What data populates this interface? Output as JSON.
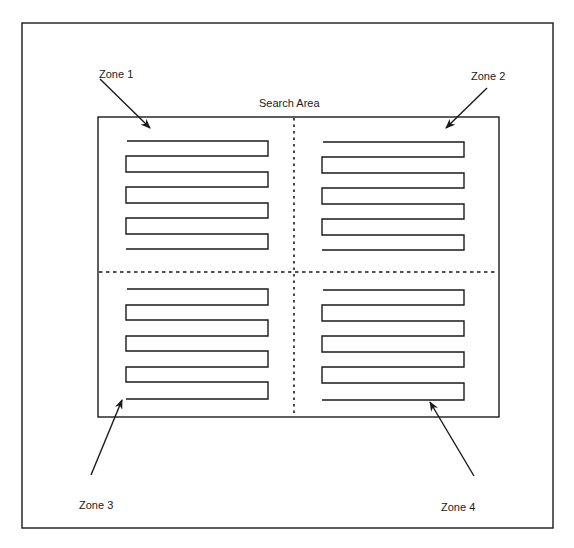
{
  "diagram": {
    "title": "Search Area",
    "zones": [
      {
        "id": 1,
        "label": "Zone 1"
      },
      {
        "id": 2,
        "label": "Zone 2"
      },
      {
        "id": 3,
        "label": "Zone 3"
      },
      {
        "id": 4,
        "label": "Zone 4"
      }
    ],
    "serpentine_legs_per_zone": 5,
    "colors": {
      "line": "#1a1a1a",
      "background": "#ffffff"
    }
  }
}
